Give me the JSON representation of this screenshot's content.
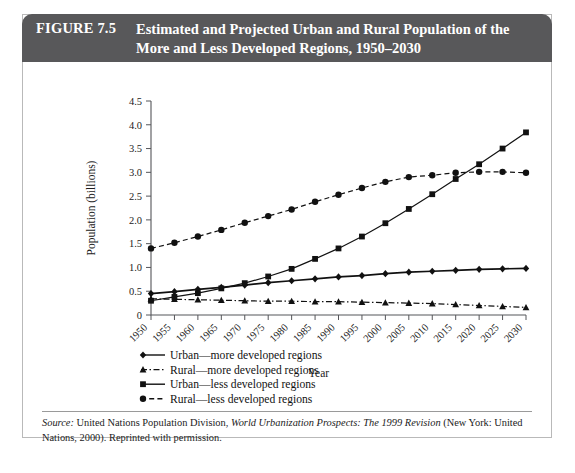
{
  "figure": {
    "number_label": "FIGURE 7.5",
    "title": "Estimated and Projected Urban and Rural Population of the More and Less Developed Regions, 1950–2030"
  },
  "source": {
    "label": "Source:",
    "text_before_work": " United Nations Population Division, ",
    "work_title": "World Urbanization Prospects: The 1999 Revision",
    "text_after_work": " (New York: United Nations, 2000). Reprinted with permission."
  },
  "chart_data": {
    "type": "line",
    "title": "",
    "xlabel": "Year",
    "ylabel": "Population (billions)",
    "x": [
      1950,
      1955,
      1960,
      1965,
      1970,
      1975,
      1980,
      1985,
      1990,
      1995,
      2000,
      2005,
      2010,
      2015,
      2020,
      2025,
      2030
    ],
    "categories": [
      "1950",
      "1955",
      "1960",
      "1965",
      "1970",
      "1975",
      "1980",
      "1985",
      "1990",
      "1995",
      "2000",
      "2005",
      "2010",
      "2015",
      "2020",
      "2025",
      "2030"
    ],
    "xlim": [
      1950,
      2030
    ],
    "ylim": [
      0,
      4.5
    ],
    "yticks": [
      0,
      0.5,
      1.0,
      1.5,
      2.0,
      2.5,
      3.0,
      3.5,
      4.0,
      4.5
    ],
    "ytick_labels": [
      "0",
      "0.5",
      "1.0",
      "1.5",
      "2.0",
      "2.5",
      "3.0",
      "3.5",
      "4.0",
      "4.5"
    ],
    "grid": false,
    "legend_position": "below",
    "series": [
      {
        "name": "Urban—more developed regions",
        "marker": "diamond",
        "dash": "solid",
        "color": "#111111",
        "values": [
          0.45,
          0.49,
          0.54,
          0.58,
          0.63,
          0.68,
          0.72,
          0.76,
          0.8,
          0.83,
          0.87,
          0.9,
          0.92,
          0.94,
          0.96,
          0.97,
          0.98
        ]
      },
      {
        "name": "Rural—more developed regions",
        "marker": "triangle",
        "dash": "dashdot",
        "color": "#111111",
        "values": [
          0.34,
          0.33,
          0.32,
          0.31,
          0.3,
          0.29,
          0.29,
          0.28,
          0.28,
          0.27,
          0.26,
          0.25,
          0.24,
          0.22,
          0.2,
          0.18,
          0.16
        ]
      },
      {
        "name": "Urban—less developed regions",
        "marker": "square",
        "dash": "solid",
        "color": "#111111",
        "values": [
          0.3,
          0.38,
          0.46,
          0.56,
          0.67,
          0.81,
          0.97,
          1.18,
          1.4,
          1.65,
          1.93,
          2.23,
          2.54,
          2.86,
          3.17,
          3.5,
          3.84
        ]
      },
      {
        "name": "Rural—less developed regions",
        "marker": "circle",
        "dash": "dashed",
        "color": "#111111",
        "values": [
          1.4,
          1.52,
          1.65,
          1.79,
          1.94,
          2.08,
          2.22,
          2.38,
          2.53,
          2.67,
          2.8,
          2.9,
          2.94,
          2.99,
          3.01,
          3.01,
          2.99
        ]
      }
    ]
  },
  "legend": {
    "items": [
      {
        "label": "Urban—more developed regions",
        "marker": "diamond",
        "dash": "solid"
      },
      {
        "label": "Rural—more developed regions",
        "marker": "triangle",
        "dash": "dashdot"
      },
      {
        "label": "Urban—less developed regions",
        "marker": "square",
        "dash": "solid"
      },
      {
        "label": "Rural—less developed regions",
        "marker": "circle",
        "dash": "dashed"
      }
    ]
  }
}
